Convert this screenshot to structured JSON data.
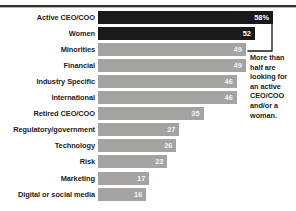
{
  "chart_data": {
    "type": "bar",
    "orientation": "horizontal",
    "title": "",
    "subtitle": "",
    "xlabel": "",
    "ylabel": "",
    "grid": false,
    "legend": false,
    "xlim": [
      0,
      58
    ],
    "categories": [
      "Active CEO/COO",
      "Women",
      "Minorities",
      "Financial",
      "Industry Specific",
      "International",
      "Retired CEO/COO",
      "Regulatory/government",
      "Technology",
      "Risk",
      "Marketing",
      "Digital or social media"
    ],
    "values": [
      58,
      52,
      49,
      49,
      46,
      46,
      35,
      27,
      26,
      23,
      17,
      16
    ],
    "value_labels": [
      "58%",
      "52",
      "49",
      "49",
      "46",
      "46",
      "35",
      "27",
      "26",
      "23",
      "17",
      "16"
    ],
    "bar_styles": [
      "dark",
      "dark",
      "light",
      "light",
      "light",
      "light",
      "light",
      "light",
      "light",
      "light",
      "light",
      "light"
    ],
    "colors": {
      "dark_bar": "#1a1818",
      "light_bar": "#a5a3a1",
      "label_text": "#1d1b1a",
      "value_text_on_dark": "#ffffff",
      "value_text_on_light": "#f4f4f3",
      "rule": "#33312f",
      "background": "#ffffff"
    },
    "annotations": [
      {
        "name": "callout-top-two-bars",
        "target_categories": [
          "Active CEO/COO",
          "Women"
        ],
        "text": "More than half are looking for an active CEO/COO and/or a woman.",
        "lines": [
          "More than",
          "half are",
          "looking for",
          "an active",
          "CEO/COO",
          "and/or a",
          "woman."
        ]
      }
    ]
  }
}
